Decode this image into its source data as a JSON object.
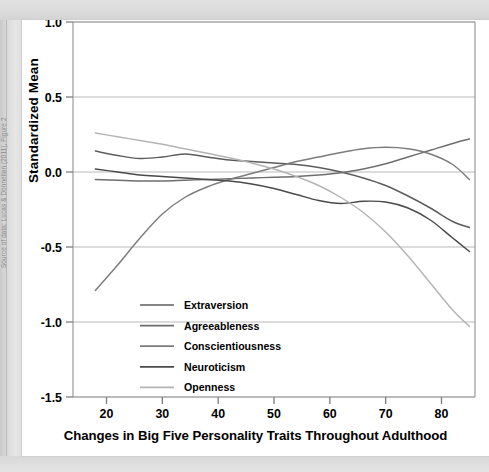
{
  "source_credit": "Source of data: Lucas & Donnellan (2011), Figure 2",
  "chart_data": {
    "type": "line",
    "title": "Changes in Big Five Personality Traits Throughout Adulthood",
    "xlabel": "Changes in Big Five Personality Traits Throughout Adulthood",
    "ylabel": "Standardized Mean",
    "xlim": [
      14,
      86
    ],
    "ylim": [
      -1.5,
      1.0
    ],
    "xticks": [
      20,
      30,
      40,
      50,
      60,
      70,
      80
    ],
    "xtick_labels": [
      "20",
      "30",
      "40",
      "50",
      "60",
      "70",
      "80"
    ],
    "yticks": [
      1.0,
      0.5,
      0.0,
      -0.5,
      -1.0,
      -1.5
    ],
    "ytick_labels": [
      "1.0",
      "0.5",
      "0.0",
      "-0.5",
      "-1.0",
      "-1.5"
    ],
    "grid": true,
    "grid_axis": "y",
    "legend_position": "center-left",
    "x": [
      18,
      22,
      26,
      30,
      34,
      38,
      42,
      46,
      50,
      54,
      58,
      62,
      66,
      70,
      74,
      78,
      82,
      85
    ],
    "series": [
      {
        "name": "Extraversion",
        "color": "#5c5c5c",
        "values": [
          0.14,
          0.11,
          0.09,
          0.1,
          0.12,
          0.1,
          0.08,
          0.07,
          0.06,
          0.05,
          0.03,
          0.0,
          -0.04,
          -0.09,
          -0.16,
          -0.24,
          -0.33,
          -0.37
        ]
      },
      {
        "name": "Agreeableness",
        "color": "#6e6e6e",
        "values": [
          -0.05,
          -0.055,
          -0.06,
          -0.06,
          -0.055,
          -0.05,
          -0.045,
          -0.04,
          -0.035,
          -0.03,
          -0.02,
          -0.005,
          0.02,
          0.055,
          0.1,
          0.145,
          0.19,
          0.22
        ]
      },
      {
        "name": "Conscientiousness",
        "color": "#7c7c7c",
        "values": [
          -0.79,
          -0.62,
          -0.44,
          -0.28,
          -0.17,
          -0.1,
          -0.05,
          -0.01,
          0.03,
          0.07,
          0.1,
          0.13,
          0.155,
          0.165,
          0.155,
          0.12,
          0.05,
          -0.05
        ]
      },
      {
        "name": "Neuroticism",
        "color": "#4a4a4a",
        "values": [
          0.02,
          0.0,
          -0.02,
          -0.03,
          -0.04,
          -0.05,
          -0.06,
          -0.08,
          -0.11,
          -0.15,
          -0.19,
          -0.21,
          -0.195,
          -0.2,
          -0.24,
          -0.32,
          -0.44,
          -0.53
        ]
      },
      {
        "name": "Openness",
        "color": "#b4b4b4",
        "values": [
          0.26,
          0.235,
          0.21,
          0.185,
          0.155,
          0.125,
          0.095,
          0.06,
          0.02,
          -0.03,
          -0.09,
          -0.17,
          -0.27,
          -0.4,
          -0.56,
          -0.74,
          -0.92,
          -1.03
        ]
      }
    ]
  }
}
